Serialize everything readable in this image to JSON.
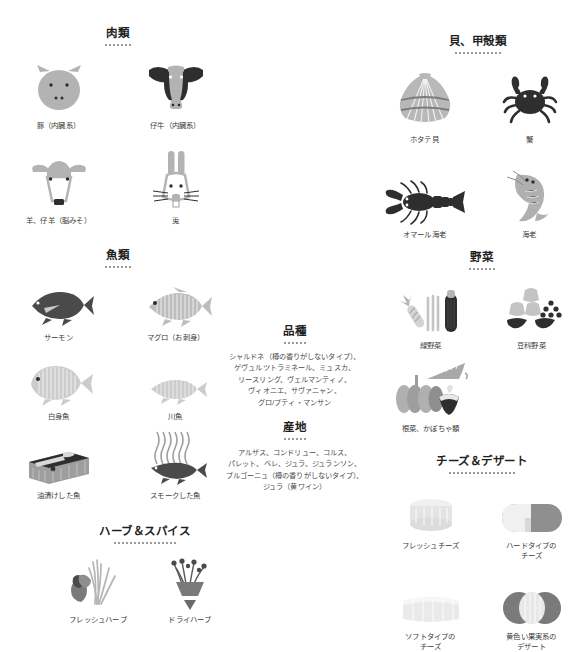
{
  "sections": {
    "meat": {
      "title": "肉類",
      "dots": 7,
      "items": [
        {
          "label": "豚（内臓系）",
          "icon": "pig-head-icon"
        },
        {
          "label": "仔牛（内臓系）",
          "icon": "calf-head-icon"
        },
        {
          "label": "羊、仔羊（脳みそ）",
          "icon": "sheep-head-icon"
        },
        {
          "label": "兎",
          "icon": "rabbit-head-icon"
        }
      ]
    },
    "fish": {
      "title": "魚類",
      "dots": 7,
      "items": [
        {
          "label": "サーモン",
          "icon": "salmon-icon"
        },
        {
          "label": "マグロ（お刺身）",
          "icon": "tuna-sashimi-icon"
        },
        {
          "label": "白身魚",
          "icon": "white-fish-icon"
        },
        {
          "label": "川魚",
          "icon": "river-fish-icon"
        },
        {
          "label": "油漬けした魚",
          "icon": "oil-cured-fish-icon"
        },
        {
          "label": "スモークした魚",
          "icon": "smoked-fish-icon"
        }
      ]
    },
    "shellfish": {
      "title": "貝、甲殻類",
      "dots": 12,
      "items": [
        {
          "label": "ホタテ貝",
          "icon": "scallop-icon"
        },
        {
          "label": "蟹",
          "icon": "crab-icon"
        },
        {
          "label": "オマール海老",
          "icon": "lobster-icon"
        },
        {
          "label": "海老",
          "icon": "shrimp-icon"
        }
      ]
    },
    "vegetables": {
      "title": "野菜",
      "dots": 7,
      "items": [
        {
          "label": "緑野菜",
          "icon": "green-vegetables-icon"
        },
        {
          "label": "豆科野菜",
          "icon": "legume-vegetables-icon"
        },
        {
          "label": "根菜、かぼちゃ類",
          "icon": "root-pumpkin-vegetables-icon"
        }
      ]
    },
    "cheese": {
      "title": "チーズ＆デザート",
      "dots": 17,
      "items": [
        {
          "label": "フレッシュチーズ",
          "icon": "fresh-cheese-icon"
        },
        {
          "label": "ハードタイプの\nチーズ",
          "icon": "hard-cheese-icon"
        },
        {
          "label": "ソフトタイプの\nチーズ",
          "icon": "soft-cheese-icon"
        },
        {
          "label": "黄色い果実系の\nデザート",
          "icon": "yellow-fruit-dessert-icon"
        }
      ]
    },
    "herbs": {
      "title": "ハーブ＆スパイス",
      "dots": 16,
      "items": [
        {
          "label": "フレッシュハーブ",
          "icon": "fresh-herbs-icon"
        },
        {
          "label": "ドライハーブ",
          "icon": "dry-herbs-icon"
        }
      ]
    }
  },
  "varieties": {
    "title": "品種",
    "dots": 6,
    "lines": [
      "シャルドネ（樽の香りがしないタイプ）、",
      "ゲヴュルツトラミネール、ミュスカ、",
      "リースリング、ヴェルマンティノ、",
      "ヴィオニエ、サヴァニャン、",
      "グロ/プティ・マンサン"
    ]
  },
  "origins": {
    "title": "産地",
    "dots": 6,
    "lines": [
      "アルザス、コンドリュー、コルス、",
      "パレット、ベレ、ジュラ、ジュランソン、",
      "ブルゴーニュ（樽の香りがしないタイプ）、",
      "ジュラ（黄ワイン）"
    ]
  },
  "colors": {
    "ink": "#2b2b2b",
    "caption": "#3a3a3a",
    "dot": "#9a9a9a",
    "gray_light": "#d7d7d7",
    "gray_mid": "#9e9e9e",
    "gray_dark": "#4a4a4a",
    "near_black": "#2e2e2e"
  }
}
